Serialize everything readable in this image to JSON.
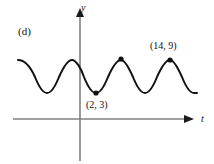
{
  "figure": {
    "panel_label": "(d)",
    "background_color": "#ffffff"
  },
  "axes": {
    "y_axis_label": "y",
    "t_axis_label": "t",
    "axis_color": "#808080",
    "origin_px": {
      "x": 80,
      "y": 119
    },
    "y_axis_top_px": 10,
    "y_axis_bottom_px": 161,
    "t_axis_left_px": 13,
    "t_axis_right_px": 191
  },
  "chart_data": {
    "type": "line",
    "title": "(d)",
    "xlabel": "t",
    "ylabel": "y",
    "grid": false,
    "legend": null,
    "curve": {
      "name": "sinusoid",
      "shape": "cosine",
      "color": "#111111",
      "stroke_width": 2,
      "midline": 6,
      "amplitude": 3,
      "period": 12,
      "minimum_value": 3,
      "maximum_value": 9,
      "t_at_first_minimum": 2,
      "t_at_labeled_maximum": 14,
      "path_px": "M 18,60 C 26,60 31,68 35,77 C 39,87 43,93 47,93 C 51,93 55,87 59,77 C 63,68 68,60 72,60 C 76,60 81,68 84,77 C 88,87 92,93 96,93 C 100,93 104,87 108,77 C 112,68 117,60 121,60 C 125,60 129,68 133,77 C 137,87 141,93 145,93 C 149,93 153,87 157,77 C 161,68 166,60 170,60 C 174,60 178,68 182,77 C 186,87 190,93 194,93 C 195,93 196,93 197,93"
    },
    "points": [
      {
        "name": "minimum-point",
        "label": "(2, 3)",
        "t": 2,
        "y": 3,
        "px": {
          "x": 96,
          "y": 93
        },
        "label_position": "below"
      },
      {
        "name": "maximum-point-unlabeled",
        "label": "",
        "t": 8,
        "y": 9,
        "px": {
          "x": 121,
          "y": 59
        },
        "label_position": "none"
      },
      {
        "name": "maximum-point-labeled",
        "label": "(14, 9)",
        "t": 14,
        "y": 9,
        "px": {
          "x": 170,
          "y": 60
        },
        "label_position": "above"
      }
    ]
  }
}
